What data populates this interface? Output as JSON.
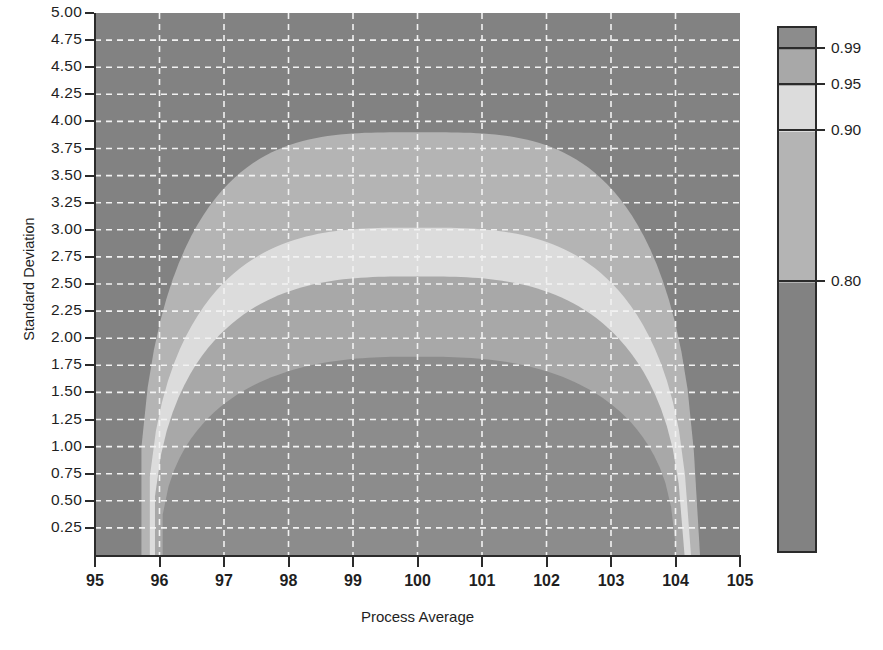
{
  "chart_data": {
    "type": "contour",
    "title": "",
    "xlabel": "Process Average",
    "ylabel": "Standard Deviation",
    "xlim": [
      95,
      105
    ],
    "ylim": [
      0.0,
      5.0
    ],
    "xticks": [
      "95",
      "96",
      "97",
      "98",
      "99",
      "100",
      "101",
      "102",
      "103",
      "104",
      "105"
    ],
    "xtick_values": [
      95,
      96,
      97,
      98,
      99,
      100,
      101,
      102,
      103,
      104,
      105
    ],
    "yticks": [
      "0.25",
      "0.50",
      "0.75",
      "1.00",
      "1.25",
      "1.50",
      "1.75",
      "2.00",
      "2.25",
      "2.50",
      "2.75",
      "3.00",
      "3.25",
      "3.50",
      "3.75",
      "4.00",
      "4.25",
      "4.50",
      "4.75",
      "5.00"
    ],
    "ytick_values": [
      0.25,
      0.5,
      0.75,
      1.0,
      1.25,
      1.5,
      1.75,
      2.0,
      2.25,
      2.5,
      2.75,
      3.0,
      3.25,
      3.5,
      3.75,
      4.0,
      4.25,
      4.5,
      4.75,
      5.0
    ],
    "grid": true,
    "grid_style": "dashed-white",
    "legend_position": "right",
    "colorbar_ticks": [
      "0.99",
      "0.95",
      "0.90",
      "0.80"
    ],
    "colorbar_tick_values": [
      0.99,
      0.95,
      0.9,
      0.8
    ],
    "levels": [
      {
        "label": "below 0.80",
        "range": "< 0.80",
        "color": "#828282"
      },
      {
        "label": "0.80 to 0.90",
        "range": "0.80–0.90",
        "color": "#b4b4b4"
      },
      {
        "label": "0.90 to 0.95",
        "range": "0.90–0.95",
        "color": "#dcdcdc"
      },
      {
        "label": "0.95 to 0.99",
        "range": "0.95–0.99",
        "color": "#a8a8a8"
      },
      {
        "label": "above 0.99",
        "range": "> 0.99",
        "color": "#8c8c8c"
      }
    ],
    "contours": {
      "note": "Probability-of-acceptance contours, nested arches centred on process average 100",
      "level_0.80": {
        "peak_x": 100.0,
        "peak_y": 3.9,
        "left_foot_x": 95.72,
        "right_foot_x": 104.38
      },
      "level_0.90": {
        "peak_x": 100.0,
        "peak_y": 3.02,
        "left_foot_x": 95.85,
        "right_foot_x": 104.24
      },
      "level_0.95": {
        "peak_x": 100.0,
        "peak_y": 2.57,
        "left_foot_x": 95.93,
        "right_foot_x": 104.14
      },
      "level_0.99": {
        "peak_x": 100.0,
        "peak_y": 1.83,
        "left_foot_x": 96.05,
        "right_foot_x": 104.02
      }
    }
  },
  "colors": {
    "background": "#ffffff",
    "plot_background": "#828282",
    "band_080_090": "#b4b4b4",
    "band_090_095": "#dcdcdc",
    "band_095_099": "#a8a8a8",
    "band_above_099": "#8c8c8c",
    "grid": "#f2f2f2",
    "axis": "#2b2b2b",
    "text": "#1f1f1f"
  }
}
